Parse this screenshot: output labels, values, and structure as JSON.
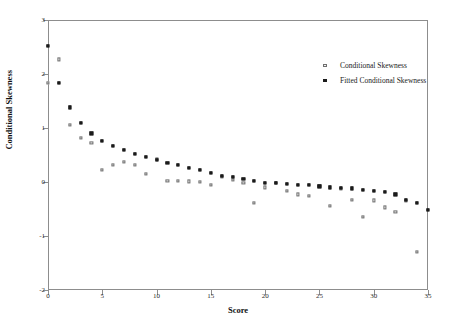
{
  "chart_data": {
    "type": "scatter",
    "title": "",
    "xlabel": "Score",
    "ylabel": "Conditional Skewness",
    "xlim": [
      0,
      35
    ],
    "ylim": [
      -2,
      3
    ],
    "xticks": [
      0,
      5,
      10,
      15,
      20,
      25,
      30,
      35
    ],
    "yticks": [
      -2,
      -1,
      0,
      1,
      2,
      3
    ],
    "grid": false,
    "legend_position": "top-right-inside",
    "legend": [
      "Conditional Skewness",
      "Fitted Conditional Skewness"
    ],
    "series": [
      {
        "name": "Conditional Skewness",
        "marker": "open-square",
        "color": "#6f6f6f",
        "x": [
          0,
          1,
          2,
          3,
          4,
          5,
          6,
          7,
          8,
          9,
          10,
          11,
          12,
          13,
          14,
          15,
          16,
          17,
          18,
          19,
          20,
          21,
          22,
          23,
          24,
          25,
          26,
          27,
          28,
          29,
          30,
          31,
          32,
          33,
          34
        ],
        "y": [
          1.83,
          2.27,
          1.05,
          0.82,
          0.73,
          0.23,
          0.31,
          0.37,
          0.31,
          0.15,
          0.43,
          0.02,
          0.02,
          0.01,
          0.0,
          -0.05,
          0.1,
          0.04,
          -0.02,
          -0.38,
          -0.1,
          -0.02,
          -0.17,
          -0.23,
          -0.25,
          -0.07,
          -0.44,
          -0.13,
          -0.33,
          -0.64,
          -0.34,
          -0.47,
          -0.55,
          -0.35,
          -1.3
        ]
      },
      {
        "name": "Fitted Conditional Skewness",
        "marker": "filled-square",
        "color": "#1b1b1b",
        "x": [
          0,
          1,
          2,
          3,
          4,
          5,
          6,
          7,
          8,
          9,
          10,
          11,
          12,
          13,
          14,
          15,
          16,
          17,
          18,
          19,
          20,
          21,
          22,
          23,
          24,
          25,
          26,
          27,
          28,
          29,
          30,
          31,
          32,
          33,
          34,
          35
        ],
        "y": [
          2.52,
          1.83,
          1.38,
          1.09,
          0.9,
          0.76,
          0.67,
          0.6,
          0.52,
          0.46,
          0.41,
          0.35,
          0.31,
          0.26,
          0.22,
          0.17,
          0.12,
          0.09,
          0.06,
          0.02,
          -0.01,
          -0.02,
          -0.04,
          -0.05,
          -0.06,
          -0.08,
          -0.1,
          -0.11,
          -0.12,
          -0.14,
          -0.16,
          -0.18,
          -0.23,
          -0.33,
          -0.39,
          -0.51
        ]
      }
    ]
  },
  "axes": {
    "x_title": "Score",
    "y_title": "Conditional Skewness"
  }
}
